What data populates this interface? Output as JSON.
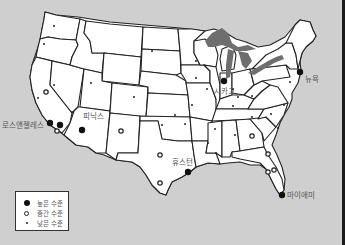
{
  "map": {
    "title": "",
    "colors": {
      "background": "#cfcfcf",
      "land": "#ffffff",
      "border": "#222222",
      "lakes": "#6e6e6e",
      "frame": "#1a1a1a"
    },
    "cities": [
      {
        "name": "로스앤젤레스",
        "level": "high",
        "x": 50,
        "y": 128
      },
      {
        "name": "피닉스",
        "level": "high",
        "x": 82,
        "y": 135
      },
      {
        "name": "시카고",
        "level": "high",
        "x": 224,
        "y": 86
      },
      {
        "name": "뉴욕",
        "level": "high",
        "x": 300,
        "y": 77
      },
      {
        "name": "휴스턴",
        "level": "high",
        "x": 188,
        "y": 177
      },
      {
        "name": "마이애미",
        "level": "high",
        "x": 282,
        "y": 200
      }
    ],
    "labels": {
      "la": "로스앤젤레스",
      "phoenix": "피닉스",
      "chicago": "시카고",
      "newyork": "뉴욕",
      "houston": "휴스턴",
      "miami": "마이애미"
    }
  },
  "legend": {
    "items": [
      {
        "symbol": "large-filled-circle",
        "label": "높은 수준"
      },
      {
        "symbol": "open-circle",
        "label": "중간 수준"
      },
      {
        "symbol": "small-dot",
        "label": "낮은 수준"
      }
    ]
  }
}
